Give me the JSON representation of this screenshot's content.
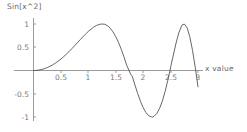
{
  "plot": {
    "title": "Sin[x^2]",
    "xlabel": "x value",
    "background_color": "#ffffff",
    "curve_color": "#555555",
    "axis_color": "#9a9a9a",
    "tick_label_color": "#7a7a7a",
    "title_color": "#6a6a6a"
  },
  "chart_data": {
    "type": "line",
    "title": "Sin[x^2]",
    "xlabel": "x value",
    "ylabel": "",
    "expression": "Sin[x^2]",
    "xlim": [
      0,
      3.05
    ],
    "ylim": [
      -1.05,
      1.05
    ],
    "grid": false,
    "legend": null,
    "xticks": [
      0.5,
      1,
      1.5,
      2,
      2.5,
      3
    ],
    "xtick_labels": [
      "0.5",
      "1",
      "1.5",
      "2",
      "2.5",
      "3"
    ],
    "yticks": [
      1,
      0.5,
      -0.5,
      -1
    ],
    "ytick_labels": [
      "1",
      "0.5",
      "-0.5",
      "-1"
    ],
    "series": [
      {
        "name": "Sin[x^2]",
        "x": [
          0,
          0.05,
          0.1,
          0.15,
          0.2,
          0.25,
          0.3,
          0.35,
          0.4,
          0.45,
          0.5,
          0.55,
          0.6,
          0.65,
          0.7,
          0.75,
          0.8,
          0.85,
          0.9,
          0.95,
          1,
          1.05,
          1.1,
          1.15,
          1.2,
          1.25,
          1.2533,
          1.3,
          1.35,
          1.4,
          1.45,
          1.5,
          1.55,
          1.6,
          1.65,
          1.7,
          1.7725,
          1.8,
          1.85,
          1.9,
          1.95,
          2,
          2.05,
          2.1,
          2.15,
          2.1708,
          2.2,
          2.25,
          2.3,
          2.35,
          2.4,
          2.45,
          2.5,
          2.5066,
          2.55,
          2.6,
          2.65,
          2.7,
          2.7082,
          2.75,
          2.8,
          2.85,
          2.9,
          2.95,
          3
        ],
        "y": [
          0,
          0.0025,
          0.01,
          0.0225,
          0.04,
          0.0625,
          0.0899,
          0.1221,
          0.1593,
          0.2013,
          0.2474,
          0.298,
          0.3523,
          0.4094,
          0.4706,
          0.5331,
          0.5972,
          0.6603,
          0.7243,
          0.7833,
          0.8415,
          0.8902,
          0.936,
          0.9692,
          0.9915,
          0.9999,
          1.0,
          0.9937,
          0.9629,
          0.9086,
          0.8302,
          0.728,
          0.6037,
          0.458,
          0.2929,
          0.1122,
          -0.0825,
          -0.1215,
          -0.3117,
          -0.4953,
          -0.6615,
          -0.7985,
          -0.9041,
          -0.9705,
          -0.998,
          -1.0,
          -0.9835,
          -0.9229,
          -0.8136,
          -0.6555,
          -0.4515,
          -0.2099,
          0.056,
          0.1045,
          0.3284,
          0.591,
          0.8094,
          0.9547,
          0.9779,
          0.9989,
          0.923,
          0.728,
          0.4334,
          0.0653,
          -0.3508
        ],
        "color": "#555555",
        "linewidth": 0.9
      }
    ]
  }
}
